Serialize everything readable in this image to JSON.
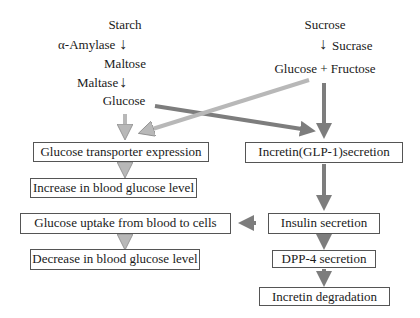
{
  "diagram": {
    "left_chain": {
      "starch": "Starch",
      "amylase": "α-Amylase",
      "maltose": "Maltose",
      "maltase": "Maltase",
      "glucose": "Glucose"
    },
    "right_chain": {
      "sucrose": "Sucrose",
      "sucrase": "Sucrase",
      "glucose_fructose": "Glucose + Fructose"
    },
    "boxes": {
      "glucose_transporter": "Glucose transporter expression",
      "incretin_secretion": "Incretin(GLP-1)secretion",
      "increase_glucose": "Increase in blood glucose level",
      "glucose_uptake": "Glucose uptake from blood to cells",
      "decrease_glucose": "Decrease in blood glucose level",
      "insulin_secretion": "Insulin secretion",
      "dpp4_secretion": "DPP-4 secretion",
      "incretin_degradation": "Incretin degradation"
    },
    "arrow_glyph": "↓",
    "colors": {
      "light_arrow": "#b8b8b8",
      "dark_arrow": "#7d7d7d",
      "box_border": "#555555",
      "text": "#1a1a1a"
    }
  }
}
